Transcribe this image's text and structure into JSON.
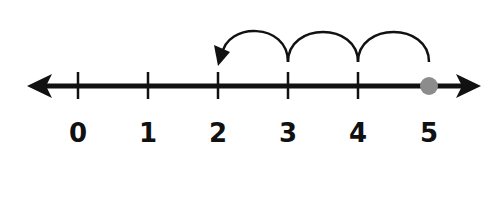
{
  "diagram": {
    "type": "number-line",
    "start_value": 5,
    "end_value": 2,
    "jumps": [
      {
        "from": 5,
        "to": 4
      },
      {
        "from": 4,
        "to": 3
      },
      {
        "from": 3,
        "to": 2
      }
    ],
    "ticks": [
      {
        "value": 0,
        "label": "0",
        "x": 78
      },
      {
        "value": 1,
        "label": "1",
        "x": 148
      },
      {
        "value": 2,
        "label": "2",
        "x": 218
      },
      {
        "value": 3,
        "label": "3",
        "x": 288
      },
      {
        "value": 4,
        "label": "4",
        "x": 358
      },
      {
        "value": 5,
        "label": "5",
        "x": 429
      }
    ],
    "colors": {
      "line": "#111111",
      "start_dot": "#8c8c8c"
    }
  }
}
